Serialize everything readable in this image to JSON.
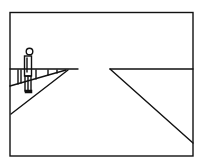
{
  "diagram": {
    "type": "perspective-sketch",
    "frame": {
      "x1": 10,
      "y1": 12,
      "x2": 193,
      "y2": 156
    },
    "horizon_y": 69,
    "elements": [
      {
        "name": "left-horizon-segment",
        "from": [
          10,
          69
        ],
        "to": [
          78,
          69
        ]
      },
      {
        "name": "right-horizon-segment",
        "from": [
          110,
          69
        ],
        "to": [
          193,
          69
        ]
      },
      {
        "name": "left-road-edge",
        "from": [
          11,
          114
        ],
        "to": [
          68,
          70
        ]
      },
      {
        "name": "right-road-edge",
        "from": [
          110,
          69
        ],
        "to": [
          193,
          143
        ]
      },
      {
        "name": "railing",
        "posts": 5
      },
      {
        "name": "standing-figure",
        "head": [
          29,
          52
        ]
      }
    ],
    "stroke_color": "#111111",
    "background_color": "#ffffff"
  }
}
